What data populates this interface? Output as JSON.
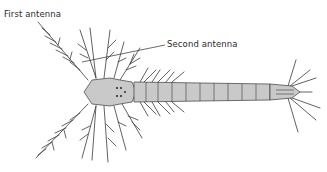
{
  "figure": {
    "labels": {
      "first_antenna": "First antenna",
      "second_antenna": "Second antenna"
    },
    "colors": {
      "body_fill": "#c9c9c9",
      "line": "#3a3a3a",
      "background": "#ffffff"
    }
  }
}
